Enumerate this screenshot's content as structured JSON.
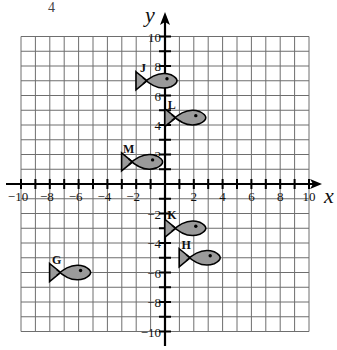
{
  "header": {
    "corner_fragment": "4"
  },
  "chart_data": {
    "type": "scatter",
    "title": "",
    "xlabel": "x",
    "ylabel": "y",
    "xlim": [
      -10,
      10
    ],
    "ylim": [
      -10,
      10
    ],
    "grid": true,
    "x_ticks": [
      -10,
      -8,
      -6,
      -4,
      -2,
      2,
      4,
      6,
      8,
      10
    ],
    "y_ticks": [
      10,
      8,
      6,
      4,
      2,
      -2,
      -4,
      -6,
      -8,
      -10
    ],
    "points": [
      {
        "label": "J",
        "x": 0,
        "y": 7,
        "shape": "fish"
      },
      {
        "label": "L",
        "x": 2,
        "y": 4.5,
        "shape": "fish"
      },
      {
        "label": "M",
        "x": -1,
        "y": 1.5,
        "shape": "fish"
      },
      {
        "label": "K",
        "x": 2,
        "y": -3,
        "shape": "fish"
      },
      {
        "label": "H",
        "x": 3,
        "y": -5,
        "shape": "fish"
      },
      {
        "label": "G",
        "x": -6,
        "y": -6,
        "shape": "fish"
      }
    ]
  },
  "style": {
    "grid_color": "#6e6e6e",
    "axis_color": "#000000",
    "fish_fill": "#9a9a9a",
    "fish_stroke": "#000000"
  }
}
